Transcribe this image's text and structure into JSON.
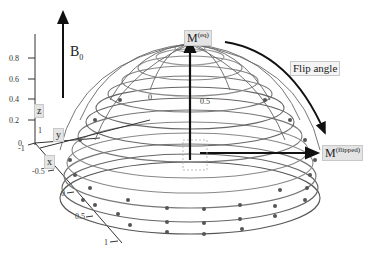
{
  "figure": {
    "field_label": "B",
    "field_subscript": "0",
    "m_eq_label": "M",
    "m_eq_superscript": "(eq)",
    "m_flipped_label": "M",
    "m_flipped_superscript": "(flipped)",
    "flip_angle_label": "Flip angle"
  },
  "axes": {
    "z": {
      "label": "z",
      "ticks": [
        "0.2",
        "0.4",
        "0.6",
        "0.8"
      ]
    },
    "y": {
      "label": "y",
      "ticks": [
        "-1",
        "1"
      ]
    },
    "x": {
      "label": "x",
      "ticks": [
        "-0.5",
        "0",
        "0.5",
        "1"
      ]
    },
    "inner_ticks": [
      "0",
      "0.5",
      "0"
    ]
  },
  "colors": {
    "mesh_dark": "#555555",
    "mesh_light": "#999999",
    "arrow": "#111111",
    "label_box": "#e4e4e4"
  }
}
